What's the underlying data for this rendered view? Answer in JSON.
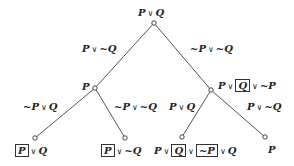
{
  "diagram": {
    "type": "resolution-tree",
    "colors": {
      "line": "#555555",
      "text": "#222222",
      "node_fill": "#ffffff"
    },
    "nodes": [
      {
        "id": "root",
        "x": 154,
        "y": 23,
        "label": "P ∨ Q"
      },
      {
        "id": "left",
        "x": 95,
        "y": 88,
        "label": "P"
      },
      {
        "id": "right",
        "x": 211,
        "y": 90,
        "label": "P ∨ [Q] ∨ ~P"
      },
      {
        "id": "ll",
        "x": 35,
        "y": 138,
        "label": "[P] ∨ Q"
      },
      {
        "id": "lr",
        "x": 125,
        "y": 138,
        "label": "[P] ∨ ~Q"
      },
      {
        "id": "rl",
        "x": 182,
        "y": 137,
        "label": "P ∨ [Q] ∨ [~P] ∨ Q"
      },
      {
        "id": "rr",
        "x": 265,
        "y": 137,
        "label": "P"
      }
    ],
    "edges": [
      {
        "from": "root",
        "to": "left",
        "label": "P ∨ ~Q"
      },
      {
        "from": "root",
        "to": "right",
        "label": "~P ∨ ~Q"
      },
      {
        "from": "left",
        "to": "ll",
        "label": "~P ∨ Q"
      },
      {
        "from": "left",
        "to": "lr",
        "label": "~P ∨ ~Q"
      },
      {
        "from": "right",
        "to": "rl",
        "label": "P ∨ Q"
      },
      {
        "from": "right",
        "to": "rr",
        "label": "P ∨ ~Q"
      }
    ]
  },
  "text": {
    "P": "P",
    "Q": "Q",
    "nP": "~P",
    "nQ": "~Q",
    "or": "∨"
  }
}
